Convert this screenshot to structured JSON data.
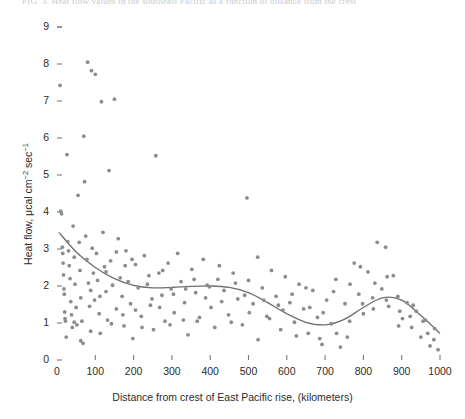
{
  "figure": {
    "clipped_header": "FIG. 3. Heat flow values in the southeast Pacific as a function of distance from the crest",
    "axis_color": "#7a7a7a",
    "point_color": "#8c8c8c",
    "curve_color": "#6e6e6e"
  },
  "chart_data": {
    "type": "scatter",
    "title": "",
    "xlabel": "Distance from crest of East Pacific rise, (kilometers)",
    "ylabel": "Heat flow, μcal cm−2 sec−1",
    "ylabel_parts": {
      "prefix": "Heat flow, μcal cm",
      "exp1": "−2",
      "mid": " sec",
      "exp2": "−1"
    },
    "xlim": [
      0,
      1000
    ],
    "ylim": [
      0,
      9
    ],
    "xticks": [
      0,
      100,
      200,
      300,
      400,
      500,
      600,
      700,
      800,
      900,
      1000
    ],
    "yticks": [
      0,
      1,
      2,
      3,
      4,
      5,
      6,
      7,
      8,
      9
    ],
    "grid": false,
    "legend": null,
    "points": [
      [
        8,
        7.42
      ],
      [
        10,
        4.02
      ],
      [
        12,
        3.95
      ],
      [
        14,
        3.05
      ],
      [
        15,
        2.88
      ],
      [
        16,
        2.62
      ],
      [
        17,
        2.3
      ],
      [
        18,
        1.92
      ],
      [
        19,
        1.78
      ],
      [
        20,
        1.3
      ],
      [
        21,
        1.12
      ],
      [
        22,
        1.05
      ],
      [
        24,
        0.62
      ],
      [
        26,
        5.55
      ],
      [
        28,
        3.2
      ],
      [
        30,
        2.95
      ],
      [
        32,
        2.55
      ],
      [
        34,
        2.2
      ],
      [
        36,
        1.58
      ],
      [
        38,
        1.22
      ],
      [
        40,
        0.88
      ],
      [
        42,
        3.62
      ],
      [
        45,
        2.78
      ],
      [
        47,
        2.05
      ],
      [
        50,
        1.42
      ],
      [
        52,
        0.95
      ],
      [
        55,
        4.45
      ],
      [
        58,
        3.18
      ],
      [
        60,
        2.42
      ],
      [
        62,
        1.68
      ],
      [
        65,
        1.05
      ],
      [
        68,
        0.45
      ],
      [
        70,
        6.05
      ],
      [
        72,
        4.82
      ],
      [
        75,
        3.35
      ],
      [
        78,
        2.72
      ],
      [
        80,
        8.05
      ],
      [
        82,
        2.08
      ],
      [
        85,
        1.45
      ],
      [
        88,
        0.78
      ],
      [
        90,
        7.82
      ],
      [
        92,
        3.02
      ],
      [
        95,
        2.35
      ],
      [
        98,
        1.62
      ],
      [
        100,
        7.72
      ],
      [
        103,
        2.88
      ],
      [
        106,
        2.15
      ],
      [
        110,
        1.25
      ],
      [
        113,
        0.72
      ],
      [
        116,
        6.98
      ],
      [
        120,
        3.45
      ],
      [
        124,
        2.52
      ],
      [
        128,
        1.85
      ],
      [
        132,
        1.08
      ],
      [
        136,
        5.12
      ],
      [
        140,
        2.68
      ],
      [
        145,
        2.02
      ],
      [
        150,
        7.05
      ],
      [
        155,
        1.38
      ],
      [
        160,
        3.28
      ],
      [
        165,
        2.22
      ],
      [
        170,
        1.72
      ],
      [
        175,
        0.92
      ],
      [
        180,
        2.95
      ],
      [
        186,
        2.12
      ],
      [
        192,
        1.52
      ],
      [
        198,
        0.58
      ],
      [
        205,
        2.58
      ],
      [
        212,
        1.95
      ],
      [
        220,
        1.18
      ],
      [
        228,
        2.82
      ],
      [
        236,
        2.05
      ],
      [
        244,
        1.48
      ],
      [
        252,
        0.82
      ],
      [
        258,
        5.52
      ],
      [
        266,
        2.35
      ],
      [
        274,
        1.75
      ],
      [
        282,
        1.05
      ],
      [
        290,
        2.62
      ],
      [
        298,
        1.92
      ],
      [
        306,
        1.28
      ],
      [
        315,
        2.88
      ],
      [
        324,
        2.12
      ],
      [
        333,
        1.55
      ],
      [
        342,
        0.68
      ],
      [
        352,
        2.45
      ],
      [
        362,
        1.82
      ],
      [
        372,
        1.15
      ],
      [
        382,
        2.72
      ],
      [
        392,
        2.02
      ],
      [
        402,
        1.42
      ],
      [
        412,
        0.88
      ],
      [
        424,
        2.55
      ],
      [
        436,
        1.88
      ],
      [
        448,
        1.22
      ],
      [
        460,
        2.35
      ],
      [
        472,
        1.65
      ],
      [
        484,
        0.95
      ],
      [
        496,
        4.38
      ],
      [
        500,
        2.15
      ],
      [
        512,
        1.52
      ],
      [
        524,
        2.78
      ],
      [
        536,
        1.95
      ],
      [
        548,
        1.18
      ],
      [
        560,
        2.42
      ],
      [
        572,
        1.72
      ],
      [
        584,
        0.82
      ],
      [
        596,
        2.25
      ],
      [
        608,
        1.55
      ],
      [
        620,
        1.02
      ],
      [
        632,
        2.05
      ],
      [
        644,
        1.38
      ],
      [
        656,
        0.72
      ],
      [
        668,
        1.88
      ],
      [
        680,
        1.15
      ],
      [
        692,
        0.42
      ],
      [
        704,
        1.62
      ],
      [
        716,
        0.98
      ],
      [
        728,
        2.18
      ],
      [
        740,
        0.35
      ],
      [
        752,
        1.52
      ],
      [
        764,
        1.05
      ],
      [
        776,
        2.62
      ],
      [
        788,
        1.78
      ],
      [
        800,
        1.25
      ],
      [
        812,
        2.38
      ],
      [
        824,
        1.68
      ],
      [
        836,
        3.18
      ],
      [
        848,
        1.92
      ],
      [
        858,
        3.05
      ],
      [
        866,
        1.45
      ],
      [
        878,
        2.28
      ],
      [
        890,
        1.72
      ],
      [
        902,
        1.12
      ],
      [
        914,
        1.55
      ],
      [
        926,
        0.88
      ],
      [
        938,
        1.32
      ],
      [
        950,
        0.62
      ],
      [
        962,
        1.08
      ],
      [
        974,
        0.38
      ],
      [
        986,
        0.85
      ],
      [
        995,
        0.28
      ],
      [
        128,
        2.38
      ],
      [
        155,
        2.92
      ],
      [
        178,
        2.55
      ],
      [
        205,
        1.35
      ],
      [
        240,
        2.28
      ],
      [
        268,
        1.42
      ],
      [
        295,
        0.95
      ],
      [
        330,
        1.08
      ],
      [
        358,
        2.18
      ],
      [
        388,
        1.68
      ],
      [
        420,
        2.18
      ],
      [
        455,
        1.02
      ],
      [
        490,
        1.75
      ],
      [
        525,
        0.55
      ],
      [
        555,
        1.12
      ],
      [
        590,
        1.35
      ],
      [
        625,
        0.65
      ],
      [
        660,
        1.42
      ],
      [
        695,
        1.28
      ],
      [
        730,
        0.72
      ],
      [
        765,
        2.05
      ],
      [
        798,
        1.52
      ],
      [
        830,
        2.08
      ],
      [
        862,
        2.25
      ],
      [
        895,
        1.32
      ],
      [
        930,
        1.48
      ],
      [
        968,
        0.72
      ],
      [
        45,
        1.02
      ],
      [
        62,
        0.52
      ],
      [
        88,
        1.88
      ],
      [
        112,
        1.72
      ],
      [
        142,
        0.98
      ],
      [
        172,
        1.22
      ],
      [
        196,
        2.72
      ],
      [
        222,
        0.88
      ],
      [
        248,
        1.65
      ],
      [
        276,
        2.42
      ],
      [
        304,
        1.78
      ],
      [
        336,
        1.92
      ],
      [
        366,
        1.05
      ],
      [
        398,
        1.98
      ],
      [
        430,
        1.58
      ],
      [
        466,
        2.08
      ],
      [
        502,
        1.28
      ],
      [
        540,
        1.62
      ],
      [
        578,
        1.48
      ],
      [
        614,
        1.78
      ],
      [
        650,
        1.95
      ],
      [
        686,
        0.58
      ],
      [
        722,
        1.85
      ],
      [
        758,
        0.62
      ],
      [
        792,
        2.52
      ],
      [
        826,
        1.38
      ],
      [
        860,
        1.62
      ],
      [
        892,
        0.92
      ],
      [
        922,
        1.18
      ],
      [
        956,
        1.05
      ],
      [
        984,
        0.55
      ]
    ],
    "trend_curve": {
      "label": "smoothed trend",
      "x": [
        5,
        50,
        100,
        150,
        200,
        250,
        300,
        350,
        400,
        450,
        500,
        550,
        600,
        650,
        700,
        750,
        800,
        850,
        900,
        950,
        1000
      ],
      "y": [
        3.45,
        2.92,
        2.5,
        2.2,
        2.02,
        1.95,
        1.96,
        1.99,
        2.0,
        1.96,
        1.82,
        1.55,
        1.25,
        1.02,
        0.95,
        1.1,
        1.42,
        1.68,
        1.62,
        1.2,
        0.72
      ]
    }
  }
}
